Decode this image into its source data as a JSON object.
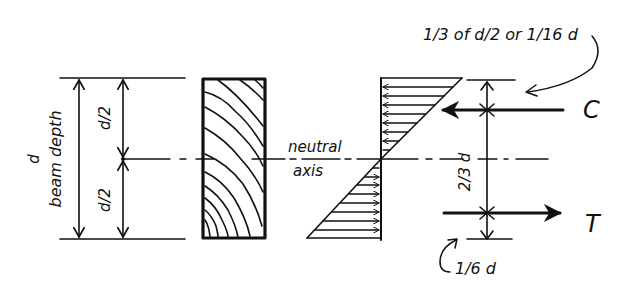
{
  "diagram": {
    "type": "beam-bending-stress-diagram",
    "labels": {
      "depth_symbol": "d",
      "depth_caption": "beam depth",
      "half_top": "d/2",
      "half_bottom": "d/2",
      "neutral_axis_line1": "neutral",
      "neutral_axis_line2": "axis",
      "compression": "C",
      "tension": "T",
      "lever_arm": "2/3 d",
      "top_note": "1/3 of d/2 or 1/16 d",
      "bottom_note": "1/6 d"
    },
    "components": [
      "dimension-lines-left",
      "wood-beam-section",
      "bending-stress-distribution",
      "resultant-forces-C-T"
    ],
    "colors": {
      "ink": "#111111",
      "background": "#ffffff"
    }
  }
}
